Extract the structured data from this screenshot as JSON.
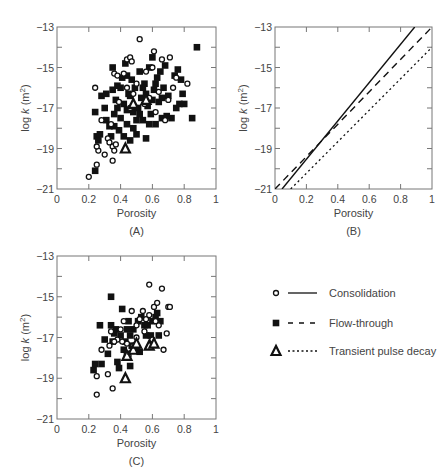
{
  "chart_data": [
    {
      "panel": "A",
      "caption": "(A)",
      "type": "scatter",
      "xlabel": "Porosity",
      "ylabel": "log k (m2)",
      "xlim": [
        0,
        1
      ],
      "ylim": [
        -21,
        -13
      ],
      "xticks": [
        "0",
        "0.2",
        "0.4",
        "0.6",
        "0.8",
        "1"
      ],
      "yticks": [
        "-13",
        "-15",
        "-17",
        "-19",
        "-21"
      ],
      "grid": false,
      "series": [
        {
          "name": "Consolidation",
          "marker": "open-circle",
          "points": [
            [
              0.2,
              -20.4
            ],
            [
              0.25,
              -19.8
            ],
            [
              0.24,
              -16.0
            ],
            [
              0.26,
              -19.1
            ],
            [
              0.25,
              -18.9
            ],
            [
              0.3,
              -19.3
            ],
            [
              0.32,
              -18.5
            ],
            [
              0.33,
              -18.7
            ],
            [
              0.35,
              -19.6
            ],
            [
              0.35,
              -18.9
            ],
            [
              0.36,
              -19.1
            ],
            [
              0.37,
              -18.8
            ],
            [
              0.28,
              -17.6
            ],
            [
              0.36,
              -15.3
            ],
            [
              0.38,
              -15.4
            ],
            [
              0.42,
              -15.3
            ],
            [
              0.44,
              -14.6
            ],
            [
              0.46,
              -14.5
            ],
            [
              0.47,
              -14.7
            ],
            [
              0.52,
              -13.6
            ],
            [
              0.61,
              -14.2
            ],
            [
              0.66,
              -14.6
            ],
            [
              0.71,
              -14.5
            ],
            [
              0.73,
              -16.0
            ],
            [
              0.75,
              -15.5
            ],
            [
              0.82,
              -15.8
            ],
            [
              0.68,
              -17.6
            ],
            [
              0.58,
              -16.5
            ],
            [
              0.5,
              -15.8
            ],
            [
              0.46,
              -17.0
            ],
            [
              0.55,
              -16.8
            ],
            [
              0.64,
              -16.2
            ],
            [
              0.39,
              -16.7
            ],
            [
              0.62,
              -17.2
            ],
            [
              0.48,
              -16.3
            ],
            [
              0.56,
              -15.2
            ],
            [
              0.44,
              -16.0
            ],
            [
              0.6,
              -15.0
            ],
            [
              0.7,
              -16.6
            ],
            [
              0.34,
              -17.8
            ]
          ]
        },
        {
          "name": "Flow-through",
          "marker": "filled-square",
          "points": [
            [
              0.24,
              -20.1
            ],
            [
              0.24,
              -17.2
            ],
            [
              0.25,
              -18.4
            ],
            [
              0.26,
              -18.6
            ],
            [
              0.27,
              -18.3
            ],
            [
              0.28,
              -16.4
            ],
            [
              0.3,
              -17.0
            ],
            [
              0.31,
              -17.6
            ],
            [
              0.31,
              -16.3
            ],
            [
              0.33,
              -17.9
            ],
            [
              0.34,
              -18.4
            ],
            [
              0.35,
              -15.0
            ],
            [
              0.35,
              -16.1
            ],
            [
              0.36,
              -17.3
            ],
            [
              0.37,
              -16.6
            ],
            [
              0.38,
              -15.9
            ],
            [
              0.39,
              -18.1
            ],
            [
              0.4,
              -17.5
            ],
            [
              0.41,
              -15.5
            ],
            [
              0.42,
              -16.8
            ],
            [
              0.43,
              -14.8
            ],
            [
              0.44,
              -17.8
            ],
            [
              0.45,
              -16.3
            ],
            [
              0.46,
              -18.6
            ],
            [
              0.47,
              -15.6
            ],
            [
              0.48,
              -17.2
            ],
            [
              0.49,
              -16.0
            ],
            [
              0.5,
              -18.3
            ],
            [
              0.51,
              -17.0
            ],
            [
              0.52,
              -15.2
            ],
            [
              0.53,
              -16.5
            ],
            [
              0.54,
              -17.6
            ],
            [
              0.55,
              -15.8
            ],
            [
              0.56,
              -18.5
            ],
            [
              0.57,
              -16.9
            ],
            [
              0.58,
              -15.0
            ],
            [
              0.59,
              -17.3
            ],
            [
              0.6,
              -14.5
            ],
            [
              0.61,
              -16.1
            ],
            [
              0.62,
              -17.8
            ],
            [
              0.63,
              -15.5
            ],
            [
              0.64,
              -16.7
            ],
            [
              0.65,
              -15.2
            ],
            [
              0.66,
              -17.5
            ],
            [
              0.67,
              -16.0
            ],
            [
              0.68,
              -14.9
            ],
            [
              0.69,
              -17.4
            ],
            [
              0.7,
              -16.4
            ],
            [
              0.72,
              -17.5
            ],
            [
              0.74,
              -15.4
            ],
            [
              0.75,
              -17.0
            ],
            [
              0.76,
              -15.1
            ],
            [
              0.77,
              -16.8
            ],
            [
              0.78,
              -15.6
            ],
            [
              0.79,
              -16.3
            ],
            [
              0.8,
              -16.8
            ],
            [
              0.85,
              -17.5
            ],
            [
              0.88,
              -14.0
            ],
            [
              0.46,
              -16.4
            ],
            [
              0.5,
              -17.6
            ],
            [
              0.44,
              -17.1
            ],
            [
              0.54,
              -16.0
            ],
            [
              0.4,
              -16.0
            ],
            [
              0.48,
              -18.0
            ],
            [
              0.58,
              -17.8
            ],
            [
              0.52,
              -17.3
            ],
            [
              0.56,
              -16.3
            ],
            [
              0.62,
              -15.8
            ],
            [
              0.42,
              -18.4
            ],
            [
              0.6,
              -16.6
            ],
            [
              0.66,
              -16.5
            ],
            [
              0.38,
              -17.0
            ],
            [
              0.36,
              -17.9
            ],
            [
              0.44,
              -15.4
            ]
          ]
        },
        {
          "name": "Transient pulse decay",
          "marker": "open-triangle",
          "points": [
            [
              0.43,
              -19.0
            ],
            [
              0.48,
              -16.8
            ],
            [
              0.56,
              -16.6
            ]
          ]
        }
      ]
    },
    {
      "panel": "B",
      "caption": "(B)",
      "type": "line",
      "xlabel": "Porosity",
      "ylabel": "log k (m2)",
      "xlim": [
        0,
        1
      ],
      "ylim": [
        -21,
        -13
      ],
      "xticks": [
        "0",
        "0.2",
        "0.4",
        "0.6",
        "0.8",
        "1"
      ],
      "yticks": [
        "-13",
        "-15",
        "-17",
        "-19",
        "-21"
      ],
      "grid": false,
      "series": [
        {
          "name": "Consolidation",
          "style": "solid",
          "x": [
            0.045,
            0.89
          ],
          "y": [
            -21,
            -13
          ]
        },
        {
          "name": "Flow-through",
          "style": "dashed",
          "x": [
            0.0,
            1.0
          ],
          "y": [
            -21,
            -13.0
          ]
        },
        {
          "name": "Transient pulse decay",
          "style": "dotted",
          "x": [
            0.1,
            1.0
          ],
          "y": [
            -21,
            -14.0
          ]
        }
      ]
    },
    {
      "panel": "C",
      "caption": "(C)",
      "type": "scatter",
      "xlabel": "Porosity",
      "ylabel": "log k (m2)",
      "xlim": [
        0,
        1
      ],
      "ylim": [
        -21,
        -13
      ],
      "xticks": [
        "0",
        "0.2",
        "0.4",
        "0.6",
        "0.8",
        "1"
      ],
      "yticks": [
        "-13",
        "-15",
        "-17",
        "-19",
        "-21"
      ],
      "grid": false,
      "series": [
        {
          "name": "Consolidation",
          "marker": "open-circle",
          "points": [
            [
              0.25,
              -19.8
            ],
            [
              0.25,
              -18.9
            ],
            [
              0.32,
              -18.8
            ],
            [
              0.35,
              -19.5
            ],
            [
              0.28,
              -17.6
            ],
            [
              0.33,
              -17.4
            ],
            [
              0.34,
              -16.7
            ],
            [
              0.38,
              -17.1
            ],
            [
              0.4,
              -16.6
            ],
            [
              0.42,
              -16.2
            ],
            [
              0.45,
              -17.9
            ],
            [
              0.47,
              -15.7
            ],
            [
              0.5,
              -16.4
            ],
            [
              0.52,
              -16.1
            ],
            [
              0.54,
              -15.7
            ],
            [
              0.55,
              -16.7
            ],
            [
              0.56,
              -16.1
            ],
            [
              0.58,
              -14.4
            ],
            [
              0.58,
              -15.9
            ],
            [
              0.6,
              -17.1
            ],
            [
              0.61,
              -15.5
            ],
            [
              0.63,
              -15.3
            ],
            [
              0.64,
              -16.4
            ],
            [
              0.66,
              -14.6
            ],
            [
              0.67,
              -17.6
            ],
            [
              0.69,
              -16.8
            ],
            [
              0.7,
              -15.5
            ],
            [
              0.71,
              -15.5
            ],
            [
              0.48,
              -17.4
            ],
            [
              0.44,
              -17.3
            ],
            [
              0.41,
              -17.2
            ],
            [
              0.36,
              -17.2
            ],
            [
              0.62,
              -16.2
            ],
            [
              0.5,
              -17.0
            ]
          ]
        },
        {
          "name": "Flow-through",
          "marker": "filled-square",
          "points": [
            [
              0.23,
              -18.6
            ],
            [
              0.24,
              -18.3
            ],
            [
              0.27,
              -16.4
            ],
            [
              0.28,
              -18.3
            ],
            [
              0.3,
              -17.1
            ],
            [
              0.32,
              -17.8
            ],
            [
              0.34,
              -16.4
            ],
            [
              0.34,
              -15.0
            ],
            [
              0.35,
              -17.2
            ],
            [
              0.36,
              -16.8
            ],
            [
              0.37,
              -16.6
            ],
            [
              0.38,
              -18.2
            ],
            [
              0.39,
              -18.5
            ],
            [
              0.4,
              -16.9
            ],
            [
              0.41,
              -15.6
            ],
            [
              0.42,
              -17.6
            ],
            [
              0.43,
              -17.2
            ],
            [
              0.44,
              -16.6
            ],
            [
              0.45,
              -16.2
            ],
            [
              0.46,
              -18.4
            ],
            [
              0.47,
              -17.4
            ],
            [
              0.48,
              -16.6
            ],
            [
              0.5,
              -17.6
            ],
            [
              0.51,
              -16.2
            ],
            [
              0.52,
              -17.7
            ],
            [
              0.53,
              -16.0
            ],
            [
              0.55,
              -16.4
            ],
            [
              0.56,
              -16.9
            ],
            [
              0.57,
              -16.4
            ],
            [
              0.59,
              -16.9
            ],
            [
              0.6,
              -16.2
            ],
            [
              0.62,
              -16.0
            ],
            [
              0.63,
              -15.8
            ],
            [
              0.64,
              -16.9
            ],
            [
              0.65,
              -16.2
            ],
            [
              0.46,
              -16.9
            ],
            [
              0.44,
              -17.8
            ]
          ]
        },
        {
          "name": "Transient pulse decay",
          "marker": "open-triangle",
          "points": [
            [
              0.43,
              -19.0
            ],
            [
              0.44,
              -17.9
            ],
            [
              0.48,
              -17.6
            ],
            [
              0.5,
              -17.3
            ],
            [
              0.58,
              -17.4
            ],
            [
              0.61,
              -17.3
            ]
          ]
        }
      ]
    }
  ],
  "legend": [
    {
      "label": "Consolidation",
      "marker": "open-circle",
      "line": "solid"
    },
    {
      "label": "Flow-through",
      "marker": "filled-square",
      "line": "dashed"
    },
    {
      "label": "Transient pulse decay",
      "marker": "open-triangle",
      "line": "dotted"
    }
  ],
  "colors": {
    "ink": "#111111",
    "frame": "#777777",
    "text": "#444444",
    "background": "#ffffff"
  }
}
